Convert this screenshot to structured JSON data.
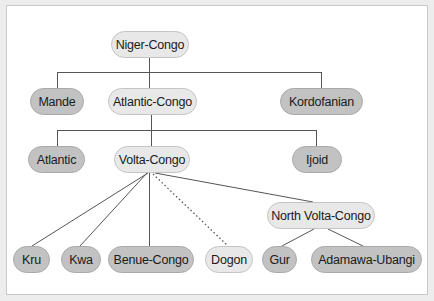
{
  "diagram": {
    "type": "tree",
    "title": "",
    "colors": {
      "background": "#ffffff",
      "frame_border": "#c9c9c9",
      "node_light_fill": "#e8e8e8",
      "node_dark_fill": "#c2c2c2",
      "line": "#555555"
    },
    "nodes": {
      "niger_congo": {
        "label": "Niger-Congo",
        "style": "light"
      },
      "mande": {
        "label": "Mande",
        "style": "dark"
      },
      "atlantic_congo": {
        "label": "Atlantic-Congo",
        "style": "light"
      },
      "kordofanian": {
        "label": "Kordofanian",
        "style": "dark"
      },
      "atlantic": {
        "label": "Atlantic",
        "style": "dark"
      },
      "volta_congo": {
        "label": "Volta-Congo",
        "style": "light"
      },
      "ijoid": {
        "label": "Ijoid",
        "style": "dark"
      },
      "north_volta_congo": {
        "label": "North Volta-Congo",
        "style": "light"
      },
      "kru": {
        "label": "Kru",
        "style": "dark"
      },
      "kwa": {
        "label": "Kwa",
        "style": "dark"
      },
      "benue_congo": {
        "label": "Benue-Congo",
        "style": "dark"
      },
      "dogon": {
        "label": "Dogon",
        "style": "light"
      },
      "gur": {
        "label": "Gur",
        "style": "dark"
      },
      "adamawa_ubangi": {
        "label": "Adamawa-Ubangi",
        "style": "dark"
      }
    },
    "edges": [
      {
        "from": "Niger-Congo",
        "to": "Mande",
        "style": "solid"
      },
      {
        "from": "Niger-Congo",
        "to": "Atlantic-Congo",
        "style": "solid"
      },
      {
        "from": "Niger-Congo",
        "to": "Kordofanian",
        "style": "solid"
      },
      {
        "from": "Atlantic-Congo",
        "to": "Atlantic",
        "style": "solid"
      },
      {
        "from": "Atlantic-Congo",
        "to": "Volta-Congo",
        "style": "solid"
      },
      {
        "from": "Atlantic-Congo",
        "to": "Ijoid",
        "style": "solid"
      },
      {
        "from": "Volta-Congo",
        "to": "Kru",
        "style": "solid"
      },
      {
        "from": "Volta-Congo",
        "to": "Kwa",
        "style": "solid"
      },
      {
        "from": "Volta-Congo",
        "to": "Benue-Congo",
        "style": "solid"
      },
      {
        "from": "Volta-Congo",
        "to": "Dogon",
        "style": "dotted"
      },
      {
        "from": "Volta-Congo",
        "to": "North Volta-Congo",
        "style": "solid"
      },
      {
        "from": "North Volta-Congo",
        "to": "Gur",
        "style": "solid"
      },
      {
        "from": "North Volta-Congo",
        "to": "Adamawa-Ubangi",
        "style": "solid"
      }
    ]
  }
}
